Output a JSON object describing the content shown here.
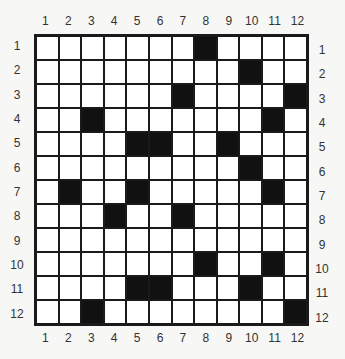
{
  "puzzle": {
    "rows": 12,
    "cols": 12,
    "column_labels": [
      "1",
      "2",
      "3",
      "4",
      "5",
      "6",
      "7",
      "8",
      "9",
      "10",
      "11",
      "12"
    ],
    "row_labels": [
      "1",
      "2",
      "3",
      "4",
      "5",
      "6",
      "7",
      "8",
      "9",
      "10",
      "11",
      "12"
    ],
    "black_cells": [
      [
        1,
        8
      ],
      [
        2,
        10
      ],
      [
        3,
        7
      ],
      [
        3,
        12
      ],
      [
        4,
        3
      ],
      [
        4,
        11
      ],
      [
        5,
        5
      ],
      [
        5,
        6
      ],
      [
        5,
        9
      ],
      [
        6,
        10
      ],
      [
        7,
        2
      ],
      [
        7,
        5
      ],
      [
        7,
        11
      ],
      [
        8,
        4
      ],
      [
        8,
        7
      ],
      [
        10,
        8
      ],
      [
        10,
        11
      ],
      [
        11,
        5
      ],
      [
        11,
        6
      ],
      [
        11,
        10
      ],
      [
        12,
        3
      ],
      [
        12,
        12
      ]
    ],
    "colors": {
      "black": "#111111",
      "white": "#ffffff",
      "line": "#1a1a1a"
    }
  }
}
